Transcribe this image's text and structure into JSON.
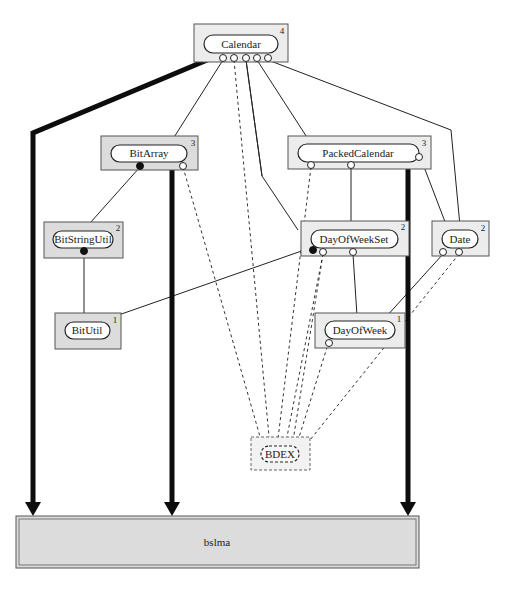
{
  "diagram": {
    "title": "",
    "components": {
      "calendar": {
        "label": "Calendar",
        "level": "4"
      },
      "bitarray": {
        "label": "BitArray",
        "level": "3"
      },
      "packedcalendar": {
        "label": "PackedCalendar",
        "level": "3"
      },
      "bitstringutil": {
        "label": "BitStringUtil",
        "level": "2"
      },
      "dayofweekset": {
        "label": "DayOfWeekSet",
        "level": "2"
      },
      "date": {
        "label": "Date",
        "level": "2"
      },
      "bitutil": {
        "label": "BitUtil",
        "level": "1"
      },
      "dayofweek": {
        "label": "DayOfWeek",
        "level": "1"
      },
      "bdex": {
        "label": "BDEX"
      },
      "bslma": {
        "label": "bslma"
      }
    },
    "edges": [
      {
        "from": "Calendar",
        "to": "bslma",
        "style": "thick-arrow"
      },
      {
        "from": "Calendar",
        "to": "BitArray",
        "style": "solid"
      },
      {
        "from": "Calendar",
        "to": "PackedCalendar",
        "style": "solid"
      },
      {
        "from": "Calendar",
        "to": "DayOfWeekSet",
        "style": "solid"
      },
      {
        "from": "Calendar",
        "to": "Date",
        "style": "solid"
      },
      {
        "from": "Calendar",
        "to": "BDEX",
        "style": "dashed"
      },
      {
        "from": "BitArray",
        "to": "BitStringUtil",
        "style": "solid"
      },
      {
        "from": "BitArray",
        "to": "bslma",
        "style": "thick-arrow"
      },
      {
        "from": "BitArray",
        "to": "BDEX",
        "style": "dashed"
      },
      {
        "from": "BitStringUtil",
        "to": "BitUtil",
        "style": "solid"
      },
      {
        "from": "PackedCalendar",
        "to": "DayOfWeekSet",
        "style": "solid"
      },
      {
        "from": "PackedCalendar",
        "to": "Date",
        "style": "solid"
      },
      {
        "from": "PackedCalendar",
        "to": "bslma",
        "style": "thick-arrow"
      },
      {
        "from": "PackedCalendar",
        "to": "BDEX",
        "style": "dashed"
      },
      {
        "from": "DayOfWeekSet",
        "to": "BitUtil",
        "style": "solid"
      },
      {
        "from": "DayOfWeekSet",
        "to": "DayOfWeek",
        "style": "solid"
      },
      {
        "from": "DayOfWeekSet",
        "to": "BDEX",
        "style": "dashed"
      },
      {
        "from": "Date",
        "to": "DayOfWeek",
        "style": "solid"
      },
      {
        "from": "Date",
        "to": "BDEX",
        "style": "dashed"
      },
      {
        "from": "DayOfWeek",
        "to": "BDEX",
        "style": "dashed"
      }
    ]
  }
}
